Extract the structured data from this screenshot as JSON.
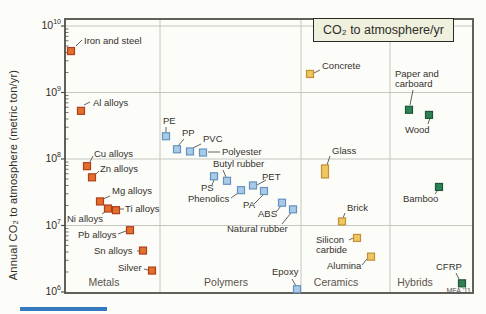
{
  "chart_data": {
    "type": "scatter",
    "title": "",
    "legend_box": "CO₂ to atmosphere/yr",
    "ylabel": "Annual CO₂ to atmosphere (metric ton/yr)",
    "yscale": "log",
    "ylim": [
      1000000.0,
      10000000000.0
    ],
    "y_ticks_exponents": [
      10,
      9,
      8,
      7,
      6
    ],
    "grid": "horizontal-major",
    "attribution": "MFA '11",
    "dividers_x": [
      160,
      301,
      390
    ],
    "categories": [
      {
        "label": "Metals",
        "x": 104
      },
      {
        "label": "Polymers",
        "x": 226
      },
      {
        "label": "Ceramics",
        "x": 336
      },
      {
        "label": "Hybrids",
        "x": 415
      }
    ],
    "series": [
      {
        "name": "Metals",
        "marker_fill": "#e2702b",
        "marker_stroke": "#af3e1e",
        "points": [
          {
            "label": "Iron and steel",
            "value": 4200000000.0,
            "x": 71,
            "lx": 84,
            "ly": 36,
            "leader": [
              76,
              46,
              82,
              40
            ]
          },
          {
            "label": "Al alloys",
            "value": 530000000.0,
            "x": 81,
            "lx": 93,
            "ly": 98,
            "leader": [
              84,
              105,
              90,
              102
            ]
          },
          {
            "label": "Cu alloys",
            "value": 78000000.0,
            "x": 87,
            "lx": 94,
            "ly": 149,
            "leader": [
              90,
              162,
              93,
              156
            ]
          },
          {
            "label": "Zn alloys",
            "value": 53000000.0,
            "x": 92,
            "lx": 100,
            "ly": 164,
            "leader": [
              96,
              174,
              99,
              171
            ]
          },
          {
            "label": "Mg alloys",
            "value": 23000000.0,
            "x": 100,
            "lx": 112,
            "ly": 186,
            "leader": [
              110,
              196,
              103,
              199
            ]
          },
          {
            "label": "Ni alloys",
            "value": 18000000.0,
            "x": 108,
            "lx": 67,
            "ly": 214,
            "leader": [
              102,
              214,
              106,
              211
            ]
          },
          {
            "label": "Ti alloys",
            "value": 17000000.0,
            "x": 116,
            "lx": 125,
            "ly": 204,
            "leader": [
              120,
              209,
              124,
              209
            ]
          },
          {
            "label": "Pb alloys",
            "value": 8500000.0,
            "x": 130,
            "lx": 78,
            "ly": 230,
            "leader": [
              118,
              234,
              126,
              231
            ]
          },
          {
            "label": "Sn alloys",
            "value": 4200000.0,
            "x": 143,
            "lx": 94,
            "ly": 246,
            "leader": [
              137,
              251,
              140,
              251
            ]
          },
          {
            "label": "Silver",
            "value": 2100000.0,
            "x": 152,
            "lx": 118,
            "ly": 263,
            "leader": [
              144,
              269,
              148,
              270
            ]
          }
        ]
      },
      {
        "name": "Polymers",
        "marker_fill": "#a9cbe7",
        "marker_stroke": "#6693be",
        "points": [
          {
            "label": "PE",
            "value": 220000000.0,
            "x": 166,
            "lx": 163,
            "ly": 116,
            "leader": [
              166,
              127,
              166,
              132
            ]
          },
          {
            "label": "PP",
            "value": 140000000.0,
            "x": 177,
            "lx": 182,
            "ly": 128,
            "leader": [
              184,
              139,
              178,
              146
            ]
          },
          {
            "label": "PVC",
            "value": 130000000.0,
            "x": 190,
            "lx": 203,
            "ly": 134,
            "leader": [
              201,
              144,
              193,
              148
            ]
          },
          {
            "label": "Polyester",
            "value": 125000000.0,
            "x": 203,
            "lx": 222,
            "ly": 147,
            "leader": [
              220,
              152,
              208,
              152
            ]
          },
          {
            "label": "PS",
            "value": 55000000.0,
            "x": 214,
            "lx": 201,
            "ly": 183,
            "leader": [
              212,
              185,
              214,
              180
            ]
          },
          {
            "label": "Butyl rubber",
            "value": 47000000.0,
            "x": 227,
            "lx": 213,
            "ly": 159,
            "leader": [
              223,
              170,
              226,
              177
            ]
          },
          {
            "label": "PET",
            "value": 40000000.0,
            "x": 253,
            "lx": 262,
            "ly": 172,
            "leader": [
              266,
              180,
              257,
              185
            ]
          },
          {
            "label": "Phenolics",
            "value": 34000000.0,
            "x": 241,
            "lx": 188,
            "ly": 194,
            "leader": [
              231,
              198,
              238,
              193
            ]
          },
          {
            "label": "PA",
            "value": 33000000.0,
            "x": 264,
            "lx": 243,
            "ly": 200,
            "leader": [
              254,
              204,
              263,
              195
            ]
          },
          {
            "label": "ABS",
            "value": 22000000.0,
            "x": 282,
            "lx": 258,
            "ly": 209,
            "leader": [
              276,
              212,
              281,
              206
            ]
          },
          {
            "label": "Natural rubber",
            "value": 17500000.0,
            "x": 293,
            "lx": 227,
            "ly": 224,
            "leader": [
              282,
              224,
              291,
              213
            ]
          },
          {
            "label": "Epoxy",
            "value": 1100000.0,
            "x": 297,
            "lx": 272,
            "ly": 267,
            "leader": [
              292,
              279,
              296,
              286
            ]
          }
        ]
      },
      {
        "name": "Ceramics",
        "marker_fill": "#efc65f",
        "marker_stroke": "#c09136",
        "points": [
          {
            "label": "Concrete",
            "value": 1900000000.0,
            "x": 310,
            "lx": 322,
            "ly": 61,
            "leader": [
              320,
              70,
              314,
              73
            ]
          },
          {
            "label": "Glass",
            "value": 65000000.0,
            "x": 325,
            "lx": 332,
            "ly": 146,
            "leader": [
              330,
              156,
              327,
              165
            ],
            "marker_h": 13
          },
          {
            "label": "Brick",
            "value": 11500000.0,
            "x": 342,
            "lx": 347,
            "ly": 203,
            "leader": [
              345,
              213,
              343,
              218
            ]
          },
          {
            "label": "Silicon\ncarbide",
            "value": 6500000.0,
            "x": 357,
            "lx": 316,
            "ly": 235,
            "leader": [
              349,
              240,
              353,
              238
            ]
          },
          {
            "label": "Alumina",
            "value": 3400000.0,
            "x": 371,
            "lx": 327,
            "ly": 261,
            "leader": [
              362,
              265,
              367,
              259
            ]
          }
        ]
      },
      {
        "name": "Hybrids",
        "marker_fill": "#2f8153",
        "marker_stroke": "#1d5737",
        "points": [
          {
            "label": "Paper and\ncarboard",
            "value": 550000000.0,
            "x": 409,
            "lx": 395,
            "ly": 69,
            "leader": [
              413,
              90,
              410,
              105
            ]
          },
          {
            "label": "Wood",
            "value": 460000000.0,
            "x": 429,
            "lx": 405,
            "ly": 125,
            "leader": [
              428,
              124,
              430,
              118
            ]
          },
          {
            "label": "Bamboo",
            "value": 38000000.0,
            "x": 439,
            "lx": 403,
            "ly": 194,
            "leader": [
              435,
              194,
              438,
              190
            ]
          },
          {
            "label": "CFRP",
            "value": 1350000.0,
            "x": 462,
            "lx": 436,
            "ly": 262,
            "leader": [
              456,
              273,
              459,
              279
            ]
          }
        ]
      }
    ]
  }
}
